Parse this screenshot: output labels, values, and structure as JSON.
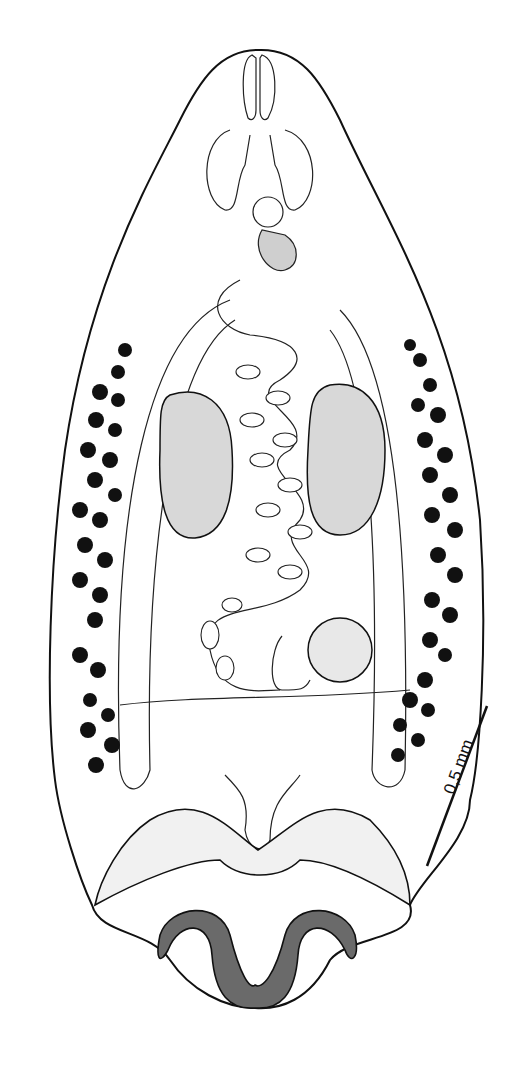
{
  "figure": {
    "scale_bar": {
      "label": "0,5 mm",
      "color": "#111111"
    },
    "colors": {
      "ink": "#111111",
      "background": "#ffffff",
      "stipple": "#d8d8d8"
    }
  }
}
